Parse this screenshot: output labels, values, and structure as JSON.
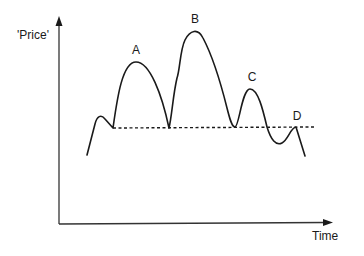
{
  "diagram": {
    "type": "price-time-sketch",
    "axes": {
      "y_label": "'Price'",
      "x_label": "Time"
    },
    "points": [
      {
        "label": "A",
        "x": 136,
        "y": 50
      },
      {
        "label": "B",
        "x": 195,
        "y": 19
      },
      {
        "label": "C",
        "x": 252,
        "y": 71
      },
      {
        "label": "D",
        "x": 297,
        "y": 113
      }
    ],
    "reference_line": {
      "style": "dashed",
      "description": "horizontal support level"
    },
    "colors": {
      "line": "#1a1a1a",
      "axis": "#333333",
      "background": "#ffffff"
    }
  }
}
